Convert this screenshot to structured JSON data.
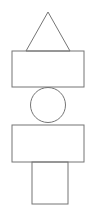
{
  "canvas": {
    "width": 96,
    "height": 217,
    "background_color": "#ffffff"
  },
  "style": {
    "stroke_color": "#757575",
    "stroke_width": 1,
    "fill_color": "none"
  },
  "figure": {
    "shape_count": 5
  },
  "shapes": [
    {
      "id": "triangle",
      "type": "triangle",
      "label": "triangle",
      "points": "48,12 70,51 26,51",
      "apex_x": 48,
      "apex_y": 12,
      "base_left_x": 26,
      "base_right_x": 70,
      "base_y": 51,
      "width": 44,
      "height": 39
    },
    {
      "id": "rectangle-upper",
      "type": "rectangle",
      "label": "upper wide rectangle",
      "x": 12,
      "y": 51,
      "width": 72,
      "height": 36
    },
    {
      "id": "circle",
      "type": "circle",
      "label": "circle",
      "cx": 48,
      "cy": 105,
      "r": 17.5,
      "width": 35,
      "height": 35
    },
    {
      "id": "rectangle-lower",
      "type": "rectangle",
      "label": "lower wide rectangle",
      "x": 12,
      "y": 125,
      "width": 72,
      "height": 37
    },
    {
      "id": "rectangle-base",
      "type": "rectangle",
      "label": "narrow base rectangle",
      "x": 32,
      "y": 162,
      "width": 36,
      "height": 42
    }
  ]
}
